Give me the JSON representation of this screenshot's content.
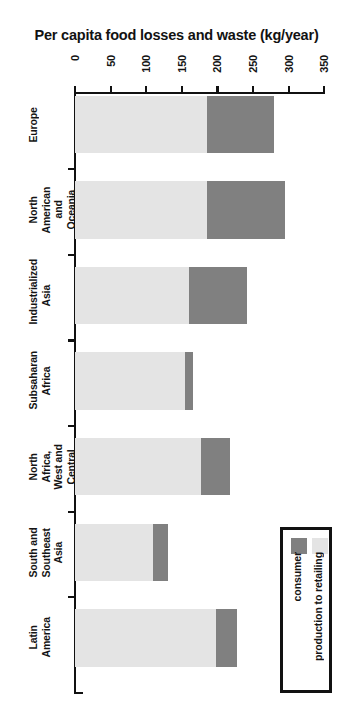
{
  "chart_data": {
    "type": "bar",
    "orientation": "horizontal-stacked",
    "title": "Per capita food losses and waste (kg/year)",
    "xlabel": "",
    "ylabel": "",
    "xlim": [
      0,
      350
    ],
    "xticks": [
      0,
      50,
      100,
      150,
      200,
      250,
      300,
      350
    ],
    "xtick_labels": [
      "0",
      "50",
      "100",
      "150",
      "200",
      "250",
      "300",
      "350"
    ],
    "grid": false,
    "legend_position": "bottom-right",
    "categories": [
      "Europe",
      "North American and Oceania",
      "Industrialized Asia",
      "Subsaharan Africa",
      "North Africa, West and Central Asia",
      "South and Southeast Asia",
      "Latin America"
    ],
    "series": [
      {
        "name": "production to retailing",
        "color": "#e4e4e4",
        "values": [
          185,
          185,
          160,
          155,
          177,
          110,
          198
        ]
      },
      {
        "name": "consumer",
        "color": "#808080",
        "values": [
          95,
          110,
          82,
          10,
          41,
          20,
          29
        ]
      }
    ],
    "totals": [
      280,
      295,
      242,
      165,
      218,
      130,
      227
    ]
  },
  "axis": {
    "ticks": [
      {
        "label": "0",
        "value": 0
      },
      {
        "label": "50",
        "value": 50
      },
      {
        "label": "100",
        "value": 100
      },
      {
        "label": "150",
        "value": 150
      },
      {
        "label": "200",
        "value": 200
      },
      {
        "label": "250",
        "value": 250
      },
      {
        "label": "300",
        "value": 300
      },
      {
        "label": "350",
        "value": 350
      }
    ]
  },
  "categories": [
    {
      "label": "Europe"
    },
    {
      "label": "North American\nand Oceania"
    },
    {
      "label": "Industrialized\nAsia"
    },
    {
      "label": "Subsaharan\nAfrica"
    },
    {
      "label": "North Africa,\nWest and\nCentral Asia"
    },
    {
      "label": "South and\nSoutheast Asia"
    },
    {
      "label": "Latin America"
    }
  ],
  "legend": {
    "entries": [
      {
        "label": "consumer",
        "color": "#808080"
      },
      {
        "label": "production to retailing",
        "color": "#e4e4e4"
      }
    ]
  },
  "colors": {
    "production": "#e4e4e4",
    "consumer": "#808080",
    "axis": "#111111",
    "text": "#141414",
    "background": "#ffffff"
  }
}
